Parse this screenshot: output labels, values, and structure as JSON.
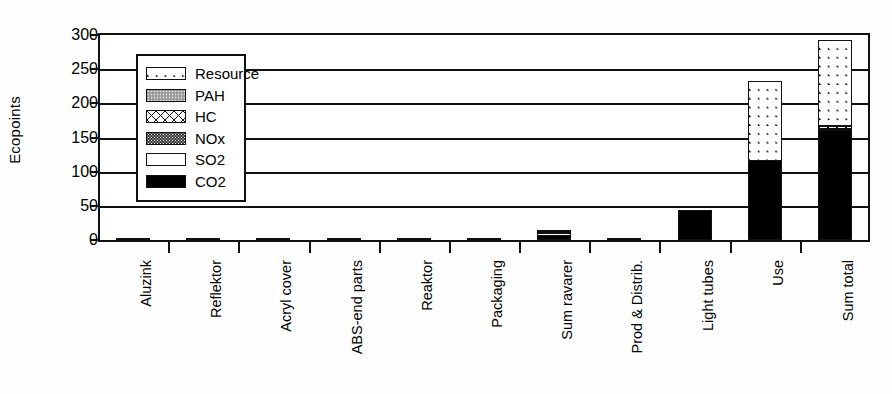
{
  "chart_data": {
    "type": "bar",
    "stacked": true,
    "title": "",
    "xlabel": "",
    "ylabel": "Ecopoints",
    "ylim": [
      0,
      300
    ],
    "yticks": [
      0,
      50,
      100,
      150,
      200,
      250,
      300
    ],
    "ytick_labels": [
      "0",
      "50",
      "100",
      "150",
      "200",
      "250",
      "300"
    ],
    "grid": true,
    "legend_position": "upper-left-inside",
    "categories": [
      "Aluzink",
      "Reflektor",
      "Acryl cover",
      "ABS-end parts",
      "Reaktor",
      "Packaging",
      "Sum ravarer",
      "Prod & Distrib.",
      "Light tubes",
      "Use",
      "Sum total"
    ],
    "series": [
      {
        "name": "CO2",
        "pattern": "solid-black",
        "color": "#000000",
        "values": [
          2.5,
          2,
          1.5,
          1,
          0.8,
          0.5,
          8,
          0.5,
          44,
          117,
          161
        ]
      },
      {
        "name": "SO2",
        "pattern": "white",
        "color": "#ffffff",
        "values": [
          0,
          0,
          0,
          0,
          0,
          0,
          1.5,
          0,
          0,
          0,
          1.5
        ]
      },
      {
        "name": "NOx",
        "pattern": "dark-dotted",
        "color": "#3a3a3a",
        "values": [
          0,
          0,
          0,
          0,
          0,
          0,
          0.5,
          0,
          0,
          0,
          1
        ]
      },
      {
        "name": "HC",
        "pattern": "cross-hatch",
        "color": "#ffffff",
        "values": [
          0,
          0,
          0,
          0,
          0,
          0,
          0.3,
          0,
          0,
          0,
          0.5
        ]
      },
      {
        "name": "PAH",
        "pattern": "gray-dotted",
        "color": "#a8a8a8",
        "values": [
          0,
          0,
          0,
          0,
          0,
          0,
          0.5,
          0,
          0,
          0,
          1
        ]
      },
      {
        "name": "Resource",
        "pattern": "diagonal-hatch",
        "color": "#ffffff",
        "values": [
          0,
          0,
          0,
          0,
          0,
          0,
          0,
          0,
          0,
          115,
          125
        ]
      }
    ],
    "totals": [
      2.5,
      2,
      1.5,
      1,
      0.8,
      0.5,
      10.8,
      0.5,
      44,
      232,
      290
    ]
  },
  "legend": {
    "items": [
      {
        "label": "Resource",
        "pattern": "diagonal-hatch"
      },
      {
        "label": "PAH",
        "pattern": "gray-dotted"
      },
      {
        "label": "HC",
        "pattern": "cross-hatch"
      },
      {
        "label": "NOx",
        "pattern": "dark-dotted"
      },
      {
        "label": "SO2",
        "pattern": "white"
      },
      {
        "label": "CO2",
        "pattern": "solid-black"
      }
    ]
  }
}
